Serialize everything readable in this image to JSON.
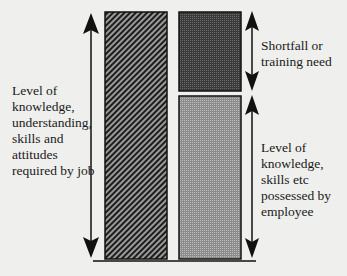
{
  "diagram": {
    "left_label": "Level of\nknowledge,\nunderstanding,\nskills and\nattitudes\nrequired by job",
    "shortfall_label": "Shortfall or\ntraining need",
    "possessed_label": "Level of\nknowledge,\nskills etc\npossessed by\nemployee",
    "colors": {
      "background": "#efefed",
      "required_bar_hatch": "#1c1c1c",
      "shortfall_bar": "#4a4a4a",
      "possessed_bar": "#a0a0a0",
      "line": "#111111"
    }
  }
}
